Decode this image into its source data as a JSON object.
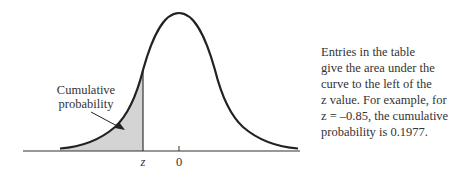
{
  "figure": {
    "type": "standard-normal-distribution-diagram",
    "shaded_region": "left tail up to z",
    "colors": {
      "curve": "#222222",
      "shade": "#d4d4d4",
      "axis": "#333333",
      "text": "#333333"
    }
  },
  "labels": {
    "region": [
      "Cumulative",
      "probability"
    ],
    "z_tick": "z",
    "zero_tick": "0"
  },
  "caption": {
    "lines": [
      "Entries in the table",
      "give the area under the",
      "curve to the left of the",
      "z value. For example, for",
      "z = –0.85, the cumulative",
      "probability is 0.1977."
    ]
  },
  "example": {
    "z": "–0.85",
    "cumulative_probability": "0.1977"
  }
}
